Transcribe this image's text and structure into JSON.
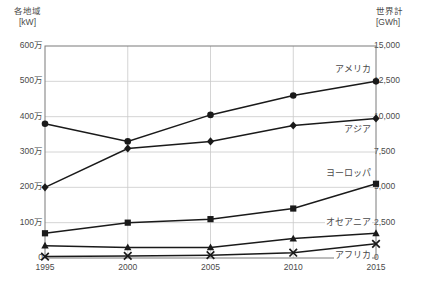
{
  "axes": {
    "left": {
      "title_line1": "各地域",
      "title_line2": "[kW]",
      "ticks": [
        "0",
        "100万",
        "200万",
        "300万",
        "400万",
        "500万",
        "600万"
      ],
      "min": 0,
      "max": 6000000
    },
    "right": {
      "title_line1": "世界計",
      "title_line2": "[GWh]",
      "ticks": [
        "0",
        "2,500",
        "5,000",
        "7,500",
        "10,000",
        "12,500",
        "15,000"
      ],
      "min": 0,
      "max": 15000
    },
    "x": {
      "ticks": [
        "1995",
        "2000",
        "2005",
        "2010",
        "2015"
      ]
    }
  },
  "series_labels": {
    "america": "アメリカ",
    "world": "世界計",
    "asia": "アジア",
    "europe": "ヨーロッパ",
    "oceania": "オセアニア",
    "africa": "アフリカ"
  },
  "colors": {
    "line": "#1a1a1a",
    "dashed": "#8a8a8a",
    "grid": "#c9c9c9",
    "frame": "#7a7a7a",
    "text": "#4a4a4a"
  },
  "caption": "",
  "chart_data": {
    "type": "line",
    "title": "",
    "xlabel": "",
    "ylabel": "各地域 [kW]",
    "y2label": "世界計 [GWh]",
    "x": [
      1995,
      2000,
      2005,
      2010,
      2015
    ],
    "categories": [
      "1995",
      "2000",
      "2005",
      "2010",
      "2015"
    ],
    "ylim": [
      0,
      6000000
    ],
    "y2lim": [
      0,
      15000
    ],
    "yticks": [
      0,
      1000000,
      2000000,
      3000000,
      4000000,
      5000000,
      6000000
    ],
    "ytick_labels": [
      "0",
      "100万",
      "200万",
      "300万",
      "400万",
      "500万",
      "600万"
    ],
    "y2ticks": [
      0,
      2500,
      5000,
      7500,
      10000,
      12500,
      15000
    ],
    "y2tick_labels": [
      "0",
      "2,500",
      "5,000",
      "7,500",
      "10,000",
      "12,500",
      "15,000"
    ],
    "grid": true,
    "legend": "inline-right-labels",
    "series": [
      {
        "name": "アメリカ",
        "axis": "left",
        "marker": "circle",
        "style": "solid",
        "values": [
          3800000,
          3300000,
          4050000,
          4600000,
          5000000
        ]
      },
      {
        "name": "世界計",
        "axis": "right",
        "marker": "none",
        "style": "dashed",
        "values": [
          6600000,
          7600000,
          8900000,
          10600000,
          12400000
        ]
      },
      {
        "name": "アジア",
        "axis": "left",
        "marker": "diamond",
        "style": "solid",
        "values": [
          2000000,
          3100000,
          3300000,
          3750000,
          3950000
        ]
      },
      {
        "name": "ヨーロッパ",
        "axis": "left",
        "marker": "square",
        "style": "solid",
        "values": [
          700000,
          1000000,
          1100000,
          1400000,
          2100000
        ]
      },
      {
        "name": "オセアニア",
        "axis": "left",
        "marker": "triangle",
        "style": "solid",
        "values": [
          350000,
          300000,
          300000,
          550000,
          700000
        ]
      },
      {
        "name": "アフリカ",
        "axis": "left",
        "marker": "cross",
        "style": "solid",
        "values": [
          40000,
          60000,
          80000,
          150000,
          400000
        ]
      }
    ]
  }
}
